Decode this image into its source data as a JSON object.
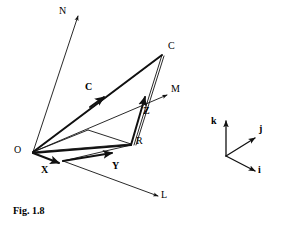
{
  "figure": {
    "caption": "Fig. 1.8",
    "stroke_color": "#111111",
    "background_color": "#ffffff",
    "labels": {
      "N": "N",
      "C_point": "C",
      "C_vector": "C",
      "M": "M",
      "Z": "Z",
      "R": "R",
      "O": "O",
      "X": "X",
      "Y": "Y",
      "L": "L",
      "k": "k",
      "j": "j",
      "i": "i"
    },
    "points": {
      "O": {
        "x": 33,
        "y": 152
      },
      "N": {
        "x": 78,
        "y": 14
      },
      "C": {
        "x": 162,
        "y": 55
      },
      "M": {
        "x": 167,
        "y": 95
      },
      "L": {
        "x": 158,
        "y": 196
      },
      "Z": {
        "x": 146,
        "y": 102
      },
      "R": {
        "x": 131,
        "y": 144
      },
      "Xt": {
        "x": 59,
        "y": 163
      },
      "Yt": {
        "x": 109,
        "y": 156
      },
      "Pi": {
        "x": 88,
        "y": 130
      }
    },
    "triad": {
      "origin": {
        "x": 226,
        "y": 156
      },
      "k_tip": {
        "x": 226,
        "y": 120
      },
      "j_tip": {
        "x": 256,
        "y": 138
      },
      "i_tip": {
        "x": 256,
        "y": 171
      }
    },
    "label_positions": {
      "N": {
        "x": 59,
        "y": 11
      },
      "C_point": {
        "x": 168,
        "y": 45
      },
      "C_vector": {
        "x": 85,
        "y": 86
      },
      "M": {
        "x": 171,
        "y": 88
      },
      "Z": {
        "x": 144,
        "y": 108
      },
      "R": {
        "x": 135,
        "y": 139
      },
      "O": {
        "x": 15,
        "y": 146
      },
      "X": {
        "x": 42,
        "y": 165
      },
      "Y": {
        "x": 112,
        "y": 163
      },
      "L": {
        "x": 162,
        "y": 192
      },
      "k": {
        "x": 212,
        "y": 119
      },
      "j": {
        "x": 260,
        "y": 127
      },
      "i": {
        "x": 259,
        "y": 167
      }
    }
  }
}
